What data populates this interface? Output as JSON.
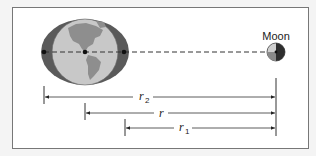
{
  "diagram": {
    "moon_label": "Moon",
    "distances": [
      {
        "symbol": "r",
        "subscript": "2",
        "description": "distance from far-side tidal bulge to Moon"
      },
      {
        "symbol": "r",
        "subscript": "",
        "description": "distance from Earth's center to Moon"
      },
      {
        "symbol": "r",
        "subscript": "1",
        "description": "distance from near-side tidal bulge to Moon"
      }
    ],
    "colors": {
      "bulge": "#5a5a5a",
      "ocean": "#c8c8c8",
      "land": "#8e8e8e",
      "moon_light": "#cfcfcf",
      "moon_dark": "#2e2e2e",
      "line": "#333333",
      "frame": "#777777",
      "background": "#f4f4f4"
    }
  }
}
